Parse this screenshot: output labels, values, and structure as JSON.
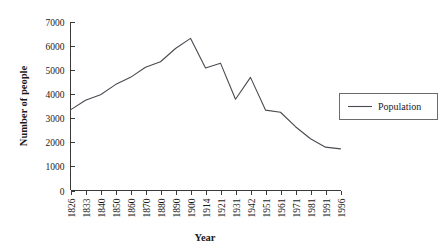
{
  "chart_data": {
    "type": "line",
    "title": "",
    "xlabel": "Year",
    "ylabel": "Number of people",
    "x": [
      1826,
      1833,
      1840,
      1850,
      1860,
      1870,
      1880,
      1890,
      1900,
      1914,
      1921,
      1931,
      1942,
      1951,
      1961,
      1971,
      1981,
      1991,
      1996
    ],
    "categories": [
      "1826",
      "1833",
      "1840",
      "1850",
      "1860",
      "1870",
      "1880",
      "1890",
      "1900",
      "1914",
      "1921",
      "1931",
      "1942",
      "1951",
      "1961",
      "1971",
      "1981",
      "1991",
      "1996"
    ],
    "series": [
      {
        "name": "Population",
        "values": [
          3350,
          3750,
          3980,
          4400,
          4700,
          5120,
          5350,
          5900,
          6320,
          5090,
          5290,
          3790,
          4700,
          3340,
          3250,
          2650,
          2150,
          1800,
          1730
        ]
      }
    ],
    "ylim": [
      0,
      7000
    ],
    "ytick_labels": [
      "0",
      "1000",
      "2000",
      "3000",
      "4000",
      "5000",
      "6000",
      "7000"
    ],
    "ytick_values": [
      0,
      1000,
      2000,
      3000,
      4000,
      5000,
      6000,
      7000
    ],
    "grid": false,
    "legend": {
      "position": "right",
      "entries": [
        {
          "label": "Population",
          "color": "#4a4a52"
        }
      ]
    }
  },
  "colors": {
    "line": "#4a4a52",
    "axis": "#3a3a3a",
    "legend_border": "#6b6b6b",
    "background": "#ffffff"
  }
}
